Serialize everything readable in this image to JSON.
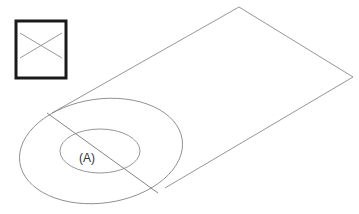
{
  "diagram": {
    "label": "(A)",
    "legend_box": {
      "symbol": "crossed-box-icon"
    },
    "colors": {
      "line": "#8a8a8a",
      "box": "#1a1a1a",
      "text": "#333333"
    }
  }
}
